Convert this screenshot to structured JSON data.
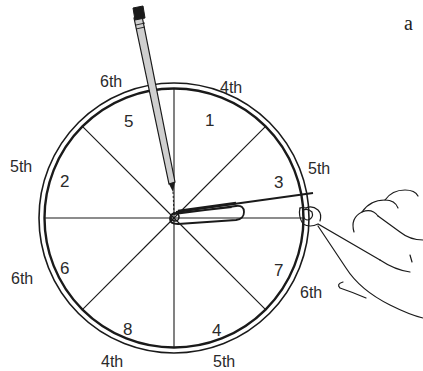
{
  "figure": {
    "panel_label": "a"
  },
  "wheel": {
    "center": [
      174,
      218
    ],
    "inner_radius": 129,
    "outer_radius": 135,
    "sector_count": 8,
    "sectors": [
      {
        "label": "1",
        "x": 211,
        "y": 120
      },
      {
        "label": "3",
        "x": 281,
        "y": 182
      },
      {
        "label": "7",
        "x": 280,
        "y": 270
      },
      {
        "label": "4",
        "x": 218,
        "y": 330
      },
      {
        "label": "8",
        "x": 129,
        "y": 329
      },
      {
        "label": "6",
        "x": 66,
        "y": 268
      },
      {
        "label": "2",
        "x": 66,
        "y": 181
      },
      {
        "label": "5",
        "x": 130,
        "y": 121
      }
    ],
    "outer_labels": [
      {
        "label": "4th",
        "x": 232,
        "y": 87
      },
      {
        "label": "5th",
        "x": 323,
        "y": 168
      },
      {
        "label": "6th",
        "x": 317,
        "y": 292
      },
      {
        "label": "5th",
        "x": 228,
        "y": 362
      },
      {
        "label": "4th",
        "x": 119,
        "y": 362
      },
      {
        "label": "6th",
        "x": 26,
        "y": 282
      },
      {
        "label": "5th",
        "x": 24,
        "y": 170
      },
      {
        "label": "6th",
        "x": 114,
        "y": 87
      }
    ]
  },
  "objects": {
    "pencil": "pencil-icon",
    "paperclip": "paperclip-icon",
    "hand": "hand-icon"
  },
  "colors": {
    "ink": "#1a1a1a",
    "pencil_fill": "#cfcfcf",
    "eraser": "#1a1a1a",
    "background": "#ffffff"
  }
}
